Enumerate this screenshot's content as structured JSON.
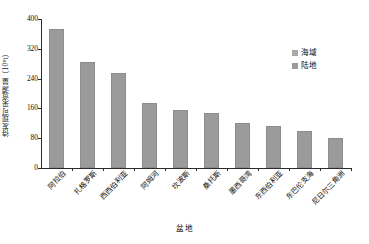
{
  "chart_data": {
    "type": "bar",
    "title": "",
    "xlabel": "盆地",
    "ylabel": "待发现可采资源量（10⁸t）",
    "ylim": [
      0,
      400
    ],
    "yticks": [
      0,
      80,
      160,
      240,
      320,
      400
    ],
    "grid": false,
    "legend_position": "top-right",
    "categories": [
      "阿拉伯",
      "扎格罗斯",
      "西西伯利亚",
      "阿姆河",
      "坎波斯",
      "桑托斯",
      "墨西哥湾",
      "东西伯利亚",
      "东巴伦支海",
      "尼日尔三角洲"
    ],
    "series": [
      {
        "name": "陆地",
        "color": "#9b9b9b",
        "values": [
          373,
          285,
          255,
          175,
          156,
          148,
          122,
          112,
          100,
          80
        ]
      }
    ],
    "legend": [
      {
        "label": "海域",
        "color": "#a8a8a8"
      },
      {
        "label": "陆地",
        "color": "#9b9b9b"
      }
    ]
  }
}
